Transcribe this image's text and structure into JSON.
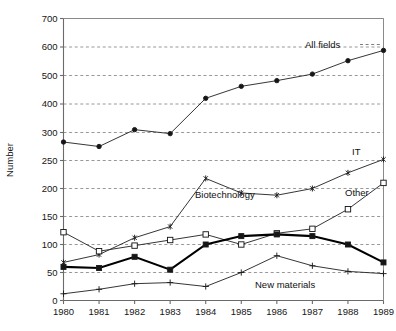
{
  "chart_data": {
    "type": "line",
    "title": "",
    "xlabel": "",
    "ylabel": "Number",
    "x": [
      1980,
      1981,
      1982,
      1983,
      1984,
      1985,
      1986,
      1987,
      1988,
      1989
    ],
    "categories": [
      "1980",
      "1981",
      "1982",
      "1983",
      "1984",
      "1985",
      "1986",
      "1987",
      "1988",
      "1989"
    ],
    "ytick_labels": [
      "0",
      "50",
      "100",
      "150",
      "200",
      "250",
      "300",
      "400",
      "500",
      "600",
      "700"
    ],
    "ytick_values": [
      0,
      50,
      100,
      150,
      200,
      250,
      300,
      400,
      500,
      600,
      700
    ],
    "ylim": [
      0,
      700
    ],
    "axis_note": "broken y-axis: 50-unit steps from 0 to 300, then 100-unit steps from 300 to 700",
    "grid": "horizontal dashed gridlines",
    "legend": "inline series labels on plot",
    "series": [
      {
        "name": "All fields",
        "marker": "filled-circle",
        "label": "All fields",
        "values": [
          283,
          275,
          310,
          298,
          420,
          462,
          482,
          505,
          552,
          588
        ]
      },
      {
        "name": "IT",
        "marker": "asterisk",
        "label": "IT",
        "values": [
          68,
          82,
          112,
          132,
          218,
          192,
          188,
          200,
          228,
          252
        ]
      },
      {
        "name": "Other",
        "marker": "open-square",
        "label": "Other",
        "values": [
          122,
          88,
          98,
          108,
          118,
          100,
          120,
          128,
          163,
          210
        ]
      },
      {
        "name": "Biotechnology",
        "marker": "filled-square",
        "label": "Biotechnology",
        "values": [
          60,
          58,
          78,
          55,
          100,
          115,
          118,
          115,
          100,
          68
        ]
      },
      {
        "name": "New materials",
        "marker": "plus",
        "label": "New materials",
        "values": [
          12,
          20,
          30,
          32,
          25,
          50,
          80,
          62,
          52,
          48
        ]
      }
    ]
  },
  "labels": {
    "all_fields": "All fields",
    "it": "IT",
    "other": "Other",
    "biotechnology": "Biotechnology",
    "new_materials": "New materials",
    "ylabel": "Number"
  }
}
